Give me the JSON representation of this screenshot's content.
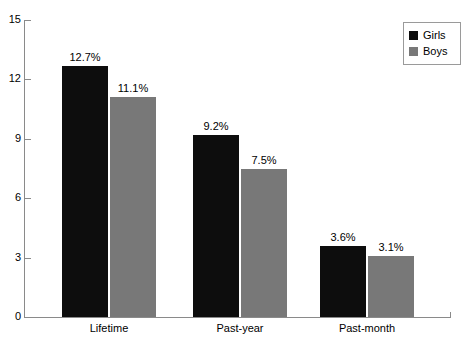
{
  "chart_data": {
    "type": "bar",
    "title": "",
    "xlabel": "",
    "ylabel": "",
    "categories": [
      "Lifetime",
      "Past-year",
      "Past-month"
    ],
    "series": [
      {
        "name": "Girls",
        "color": "#0d0d0d",
        "values": [
          12.7,
          9.2,
          3.6
        ],
        "labels": [
          "12.7%",
          "9.2%",
          "3.6%"
        ]
      },
      {
        "name": "Boys",
        "color": "#787878",
        "values": [
          11.1,
          7.5,
          3.1
        ],
        "labels": [
          "11.1%",
          "7.5%",
          "3.1%"
        ]
      }
    ],
    "ylim": [
      0,
      15
    ],
    "yticks": [
      0,
      3,
      6,
      9,
      12,
      15
    ],
    "ytick_labels": [
      "0",
      "3",
      "6",
      "9",
      "12",
      "15"
    ],
    "grid": false,
    "legend_position": "top-right"
  },
  "axis": {
    "y_labels": [
      "15",
      "12",
      "9",
      "6",
      "3",
      "0"
    ],
    "x_labels": [
      "Lifetime",
      "Past-year",
      "Past-month"
    ]
  },
  "legend": {
    "entries": [
      {
        "label": "Girls",
        "color": "#0d0d0d"
      },
      {
        "label": "Boys",
        "color": "#787878"
      }
    ]
  },
  "bars": [
    {
      "label": "12.7%",
      "series": "Girls",
      "category": "Lifetime"
    },
    {
      "label": "11.1%",
      "series": "Boys",
      "category": "Lifetime"
    },
    {
      "label": "9.2%",
      "series": "Girls",
      "category": "Past-year"
    },
    {
      "label": "7.5%",
      "series": "Boys",
      "category": "Past-year"
    },
    {
      "label": "3.6%",
      "series": "Girls",
      "category": "Past-month"
    },
    {
      "label": "3.1%",
      "series": "Boys",
      "category": "Past-month"
    }
  ]
}
